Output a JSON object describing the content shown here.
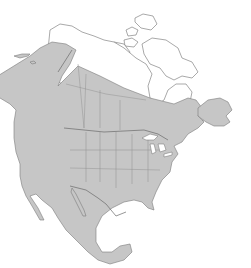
{
  "map": {
    "region": "North America",
    "type": "range map",
    "colors": {
      "background": "#ffffff",
      "range_fill": "#c6c6c6",
      "outside_fill": "#ffffff",
      "outline": "#6e6e6e",
      "border": "#8e8e8e"
    },
    "shaded_areas": [
      "Alaska (interior and south)",
      "Canada (south of Arctic)",
      "Contiguous United States",
      "Mexico"
    ],
    "unshaded_areas": [
      "Northern Alaska coast",
      "Canadian Arctic Archipelago",
      "Northern Nunavut / Hudson Bay region"
    ]
  }
}
